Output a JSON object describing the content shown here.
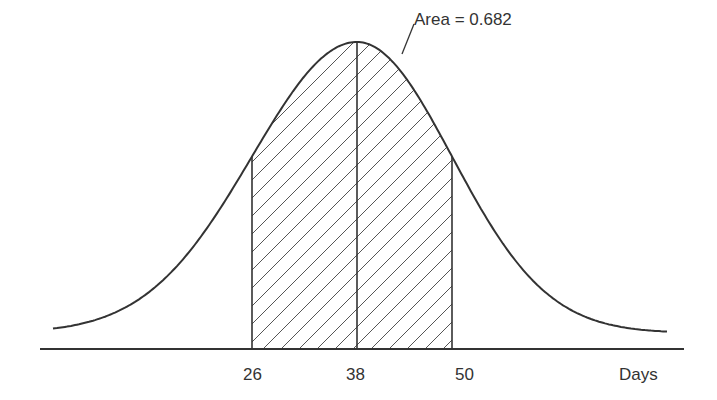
{
  "chart_data": {
    "type": "area",
    "title": "",
    "subtitle": "",
    "xlabel": "Days",
    "ylabel": "",
    "distribution": {
      "mean": 38,
      "sd": 12
    },
    "x_ticks": [
      26,
      38,
      50
    ],
    "shaded_region": {
      "from": 26,
      "to": 50,
      "pattern": "diagonal-hatch"
    },
    "vertical_lines": [
      26,
      38,
      50
    ],
    "annotations": [
      {
        "text": "Area = 0.682",
        "points_to": "shaded region"
      }
    ],
    "grid": false,
    "legend": null,
    "xlim": [
      11,
      64
    ]
  },
  "labels": {
    "area": "Area = 0.682",
    "tick_26": "26",
    "tick_38": "38",
    "tick_50": "50",
    "x_axis": "Days"
  },
  "colors": {
    "line": "#333333",
    "hatch": "#555555",
    "text": "#333333"
  }
}
